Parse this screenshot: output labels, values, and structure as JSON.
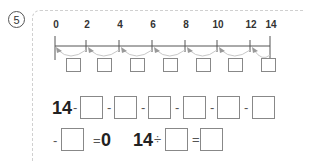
{
  "question": {
    "number": "5"
  },
  "number_line": {
    "ticks": [
      "0",
      "2",
      "4",
      "6",
      "8",
      "10",
      "12",
      "14"
    ],
    "jump_boxes": 7
  },
  "equation1": {
    "start": "14",
    "operator": "-",
    "boxes": 7,
    "result_sign": "=",
    "result": "0"
  },
  "equation2": {
    "start": "14",
    "operator": "÷",
    "equals": "="
  }
}
